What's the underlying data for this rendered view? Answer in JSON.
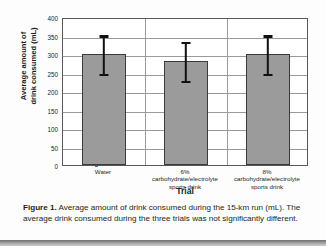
{
  "chart_data": {
    "type": "bar",
    "title": "",
    "categories": [
      "Water",
      "6% carbohydrate/electrolyte sports drink",
      "8% carbohydrate/electrolyte sports drink"
    ],
    "category_lines": [
      [
        "Water"
      ],
      [
        "6%",
        "carbohydrate/electrolyte",
        "sports drink"
      ],
      [
        "8%",
        "carbohydrate/electrolyte",
        "sports drink"
      ]
    ],
    "values": [
      300,
      280,
      299
    ],
    "error_low": [
      249,
      230,
      248
    ],
    "error_high": [
      353,
      335,
      353
    ],
    "xlabel": "Trial",
    "ylabel": "Average amount of drink consumed (mL)",
    "ylabel_lines": [
      "Average amount of",
      "drink consumed (mL)"
    ],
    "ylim": [
      0,
      400
    ],
    "ytick_step": 50,
    "yticks": [
      0,
      50,
      100,
      150,
      200,
      250,
      300,
      350,
      400
    ],
    "grid": true,
    "legend": "none",
    "bar_color": "#9b9b9b",
    "bar_border_color": "#3a3a3a",
    "error_color": "#111111",
    "axis_color": "#58585a",
    "grid_color": "#9a9a9c"
  },
  "caption": {
    "label": "Figure 1.",
    "text": " Average amount of drink consumed during the 15-km run (mL). The average drink consumed during the three trials was not significantly different."
  }
}
